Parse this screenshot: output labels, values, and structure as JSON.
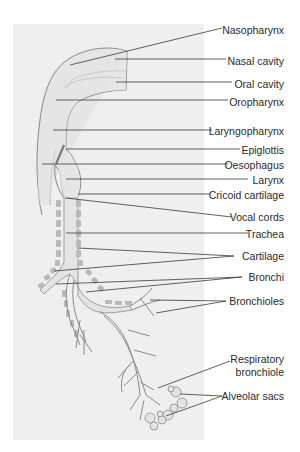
{
  "diagram": {
    "colors": {
      "panel": "#efefef",
      "airway_fill": "#e4e4e4",
      "outline": "#8a8a8a",
      "cartilage": "#b9b9b9",
      "leader": "#3a3a3a",
      "text": "#2a2a2a"
    },
    "labels": [
      {
        "id": "nasopharynx",
        "text": "Nasopharynx",
        "y": 24
      },
      {
        "id": "nasal-cavity",
        "text": "Nasal cavity",
        "y": 55
      },
      {
        "id": "oral-cavity",
        "text": "Oral cavity",
        "y": 78
      },
      {
        "id": "oropharynx",
        "text": "Oropharynx",
        "y": 96
      },
      {
        "id": "laryngopharynx",
        "text": "Laryngopharynx",
        "y": 126
      },
      {
        "id": "epiglottis",
        "text": "Epiglottis",
        "y": 145
      },
      {
        "id": "oesophagus",
        "text": "Oesophagus",
        "y": 159
      },
      {
        "id": "larynx",
        "text": "Larynx",
        "y": 174
      },
      {
        "id": "cricoid-cartilage",
        "text": "Cricoid cartilage",
        "y": 190
      },
      {
        "id": "vocal-cords",
        "text": "Vocal cords",
        "y": 211
      },
      {
        "id": "trachea",
        "text": "Trachea",
        "y": 229
      },
      {
        "id": "cartilage",
        "text": "Cartilage",
        "y": 251
      },
      {
        "id": "bronchi",
        "text": "Bronchi",
        "y": 272
      },
      {
        "id": "bronchioles",
        "text": "Bronchioles",
        "y": 296
      },
      {
        "id": "respiratory-bronchiole",
        "text": "Respiratory bronchiole",
        "line1": "Respiratory",
        "line2": "bronchiole",
        "y": 355
      },
      {
        "id": "alveolar-sacs",
        "text": "Alveolar sacs",
        "y": 391
      }
    ]
  }
}
